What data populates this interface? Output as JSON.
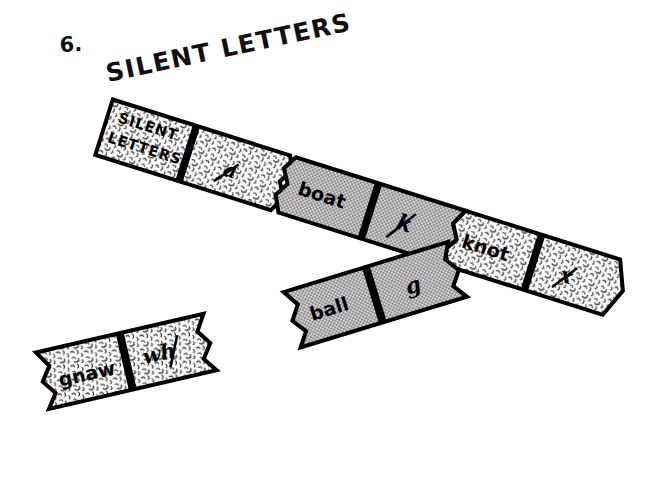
{
  "page": {
    "title": "6. SILENT LETTERS",
    "title_number": "6.",
    "title_text": "SILENT LETTERS",
    "background_color": "#ffffff",
    "ink_color": "#000000",
    "gray_panel_color": "#b8b8b8",
    "textured_panel_color": "#f2f2f0"
  },
  "banners": [
    {
      "id": "main-strip",
      "segments": [
        {
          "id": "seg-heading",
          "text": "SILENT\nLETTERS",
          "line1": "SILENT",
          "line2": "LETTERS",
          "fill": "textured",
          "kind": "heading"
        },
        {
          "id": "seg-a",
          "text": "a",
          "fill": "textured",
          "kind": "silent-letter",
          "struck": true
        },
        {
          "id": "seg-boat",
          "text": "boat",
          "fill": "gray",
          "kind": "word"
        },
        {
          "id": "seg-k",
          "text": "k",
          "fill": "gray",
          "kind": "silent-letter",
          "struck": true
        },
        {
          "id": "seg-knot",
          "text": "knot",
          "fill": "textured",
          "kind": "word"
        },
        {
          "id": "seg-x",
          "text": "x",
          "fill": "textured",
          "kind": "silent-letter",
          "struck": true
        }
      ]
    },
    {
      "id": "ball-banner",
      "segments": [
        {
          "id": "seg-ball",
          "text": "ball",
          "fill": "gray",
          "kind": "word"
        },
        {
          "id": "seg-g",
          "text": "g",
          "fill": "gray",
          "kind": "silent-letter",
          "struck": false
        }
      ]
    },
    {
      "id": "gnaw-banner",
      "segments": [
        {
          "id": "seg-gnaw",
          "text": "gnaw",
          "fill": "textured",
          "kind": "word"
        },
        {
          "id": "seg-wh",
          "text": "wh",
          "fill": "textured",
          "kind": "silent-letter",
          "struck": true
        }
      ]
    }
  ]
}
